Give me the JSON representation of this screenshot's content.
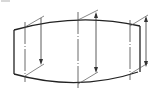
{
  "figure": {
    "type": "technical-drawing",
    "corner_label": "",
    "colors": {
      "line": "#222222",
      "background": "#ffffff"
    },
    "outline": {
      "left_edge": {
        "x": 14,
        "y1": 30,
        "y2": 74
      },
      "right_edge": {
        "x": 140,
        "y1": 26,
        "y2": 72
      },
      "top_curve": [
        [
          14,
          30
        ],
        [
          78,
          20
        ],
        [
          140,
          26
        ]
      ],
      "bottom_curve": [
        [
          14,
          74
        ],
        [
          78,
          84
        ],
        [
          138,
          72
        ]
      ]
    },
    "centerlines": [
      {
        "id": "left",
        "x": 25,
        "y1": 22,
        "y2": 82
      },
      {
        "id": "middle",
        "x": 78,
        "y1": 12,
        "y2": 88
      },
      {
        "id": "right",
        "x": 130,
        "y1": 20,
        "y2": 80
      }
    ],
    "dimensions": [
      {
        "id": "dim-left",
        "x": 41,
        "y1": 18,
        "y2": 64,
        "arrowheads": "end"
      },
      {
        "id": "dim-middle",
        "x": 96,
        "y1": 12,
        "y2": 72,
        "arrowheads": "both"
      },
      {
        "id": "dim-right",
        "x": 146,
        "y1": 16,
        "y2": 66,
        "arrowheads": "both"
      }
    ]
  }
}
